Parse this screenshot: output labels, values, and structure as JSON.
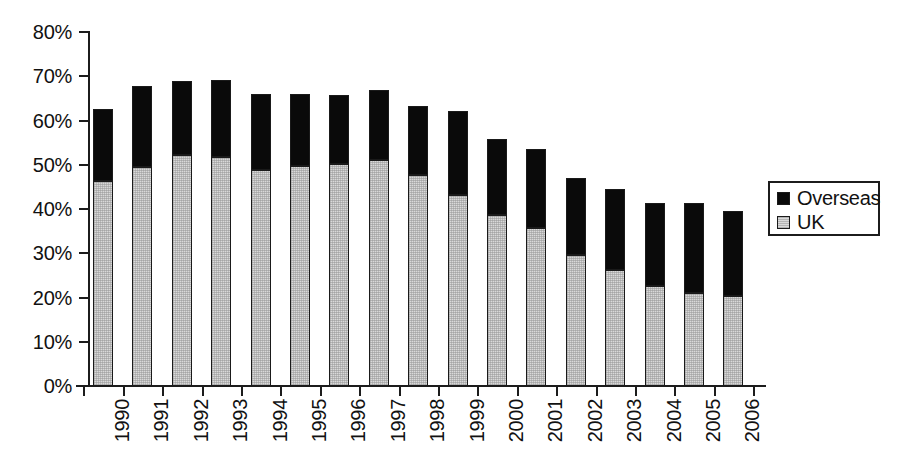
{
  "chart_data": {
    "type": "bar",
    "subtype": "stacked-column",
    "title": "",
    "xlabel": "",
    "ylabel": "",
    "ylim": [
      0,
      80
    ],
    "ytick_labels": [
      "0%",
      "10%",
      "20%",
      "30%",
      "40%",
      "50%",
      "60%",
      "70%",
      "80%"
    ],
    "ytick_values": [
      0,
      10,
      20,
      30,
      40,
      50,
      60,
      70,
      80
    ],
    "grid": false,
    "legend_position": "right",
    "categories": [
      "1990",
      "1991",
      "1992",
      "1993",
      "1994",
      "1995",
      "1996",
      "1997",
      "1998",
      "1999",
      "2000",
      "2001",
      "2002",
      "2003",
      "2004",
      "2005",
      "2006"
    ],
    "series": [
      {
        "name": "UK",
        "color": "#d9d9d9",
        "values": [
          46.3,
          49.6,
          52.3,
          51.8,
          48.9,
          49.7,
          50.1,
          51.1,
          47.6,
          43.2,
          38.6,
          35.7,
          29.6,
          26.2,
          22.7,
          21.0,
          20.3
        ]
      },
      {
        "name": "Overseas",
        "color": "#0a0a0a",
        "values": [
          16.4,
          18.2,
          16.7,
          17.4,
          17.0,
          16.3,
          15.7,
          15.8,
          15.6,
          18.9,
          17.2,
          17.9,
          17.4,
          18.4,
          18.7,
          20.4,
          19.2
        ]
      }
    ],
    "totals": [
      62.7,
      67.8,
      69.0,
      69.2,
      65.9,
      66.0,
      65.8,
      66.9,
      63.2,
      62.1,
      55.8,
      53.6,
      47.0,
      44.6,
      41.4,
      41.4,
      39.5
    ]
  },
  "legend": {
    "entries": [
      {
        "label": "Overseas",
        "swatch": "overseas-swatch"
      },
      {
        "label": "UK",
        "swatch": "uk-swatch"
      }
    ]
  }
}
